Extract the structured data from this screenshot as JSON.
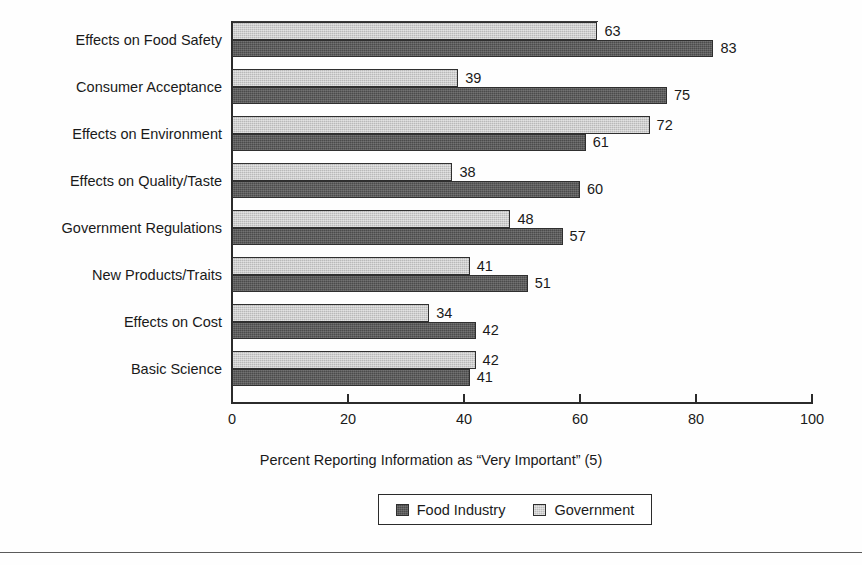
{
  "chart_data": {
    "type": "bar",
    "orientation": "horizontal",
    "title": "",
    "xlabel": "Percent Reporting Information as “Very Important” (5)",
    "ylabel": "",
    "xlim": [
      0,
      100
    ],
    "xticks": [
      0,
      20,
      40,
      60,
      80,
      100
    ],
    "xtick_labels": [
      "0",
      "20",
      "40",
      "60",
      "80",
      "100"
    ],
    "grid": false,
    "legend_position": "bottom-center",
    "categories": [
      "Effects on Food Safety",
      "Consumer Acceptance",
      "Effects on Environment",
      "Effects on Quality/Taste",
      "Government Regulations",
      "New Products/Traits",
      "Effects on Cost",
      "Basic Science"
    ],
    "series": [
      {
        "name": "Government",
        "color": "#b9b9b9",
        "values": [
          63,
          39,
          72,
          38,
          48,
          41,
          34,
          42
        ]
      },
      {
        "name": "Food Industry",
        "color": "#4b4b4b",
        "values": [
          83,
          75,
          61,
          60,
          57,
          51,
          42,
          41
        ]
      }
    ],
    "data_labels": {
      "Government": [
        "63",
        "39",
        "72",
        "38",
        "48",
        "41",
        "34",
        "42"
      ],
      "Food Industry": [
        "83",
        "75",
        "61",
        "60",
        "57",
        "51",
        "42",
        "41"
      ]
    }
  },
  "legend": {
    "entries": [
      {
        "label": "Food Industry",
        "swatch": "dark-gray-swatch"
      },
      {
        "label": "Government",
        "swatch": "light-gray-swatch"
      }
    ]
  }
}
